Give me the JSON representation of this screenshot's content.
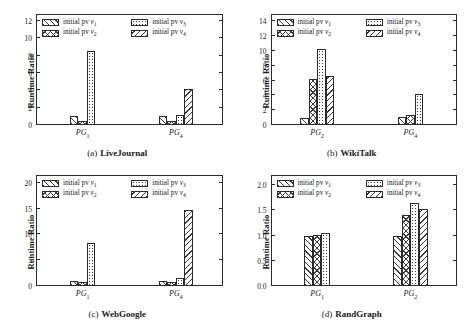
{
  "figure": {
    "ylabel": "Runtime Ratio",
    "legend_labels": [
      "initial pv v1",
      "initial pv v2",
      "initial pv v3",
      "initial pv v4"
    ],
    "legend_prefix": "initial pv",
    "series_names": [
      "v1",
      "v2",
      "v3",
      "v4"
    ],
    "series_patterns": [
      "backward-diagonal-hatch",
      "crosshatch",
      "dotted",
      "forward-diagonal-hatch"
    ],
    "colors": {
      "axis": "#2b2b2b",
      "hatch": "#3a3a3a",
      "background": "#ffffff",
      "text": "#1a1a1a"
    }
  },
  "chart_data": [
    {
      "type": "bar",
      "panel": "a",
      "caption_tag": "(a)",
      "title": "LiveJournal",
      "xlabel": "",
      "ylabel": "Runtime Ratio",
      "categories": [
        "PG1",
        "PG4"
      ],
      "category_labels": [
        "PG",
        "PG"
      ],
      "category_subs": [
        "1",
        "4"
      ],
      "yticks": [
        0,
        2,
        4,
        6,
        8,
        10,
        12
      ],
      "ytick_labels": [
        "0",
        "2",
        "4",
        "6",
        "8",
        "10",
        "12"
      ],
      "ylim": [
        0,
        12.8
      ],
      "grid": false,
      "legend_position": "upper-left-inside",
      "series": [
        {
          "name": "v1",
          "values": [
            1.0,
            1.0
          ]
        },
        {
          "name": "v2",
          "values": [
            0.5,
            0.5
          ]
        },
        {
          "name": "v3",
          "values": [
            8.5,
            1.2
          ]
        },
        {
          "name": "v4",
          "values": [
            0.0,
            4.1
          ]
        }
      ]
    },
    {
      "type": "bar",
      "panel": "b",
      "caption_tag": "(b)",
      "title": "WikiTalk",
      "xlabel": "",
      "ylabel": "Runtime Ratio",
      "categories": [
        "PG2",
        "PG4"
      ],
      "category_labels": [
        "PG",
        "PG"
      ],
      "category_subs": [
        "2",
        "4"
      ],
      "yticks": [
        0,
        2,
        4,
        6,
        8,
        10,
        12,
        14
      ],
      "ytick_labels": [
        "0",
        "2",
        "4",
        "6",
        "8",
        "10",
        "12",
        "14"
      ],
      "ylim": [
        0,
        15.0
      ],
      "grid": false,
      "legend_position": "upper-left-inside",
      "series": [
        {
          "name": "v1",
          "values": [
            1.0,
            1.1
          ]
        },
        {
          "name": "v2",
          "values": [
            6.2,
            1.4
          ]
        },
        {
          "name": "v3",
          "values": [
            10.3,
            4.2
          ]
        },
        {
          "name": "v4",
          "values": [
            6.6,
            0.0
          ]
        }
      ]
    },
    {
      "type": "bar",
      "panel": "c",
      "caption_tag": "(c)",
      "title": "WebGoogle",
      "xlabel": "",
      "ylabel": "Runtime Ratio",
      "categories": [
        "PG1",
        "PG4"
      ],
      "category_labels": [
        "PG",
        "PG"
      ],
      "category_subs": [
        "1",
        "4"
      ],
      "yticks": [
        0,
        5,
        10,
        15,
        20
      ],
      "ytick_labels": [
        "0",
        "5",
        "10",
        "15",
        "20"
      ],
      "ylim": [
        0,
        21.5
      ],
      "grid": false,
      "legend_position": "upper-left-inside",
      "series": [
        {
          "name": "v1",
          "values": [
            1.0,
            1.0
          ]
        },
        {
          "name": "v2",
          "values": [
            0.7,
            0.8
          ]
        },
        {
          "name": "v3",
          "values": [
            8.4,
            1.6
          ]
        },
        {
          "name": "v4",
          "values": [
            0.0,
            14.8
          ]
        }
      ]
    },
    {
      "type": "bar",
      "panel": "d",
      "caption_tag": "(d)",
      "title": "RandGraph",
      "xlabel": "",
      "ylabel": "Runtime Ratio",
      "categories": [
        "PG1",
        "PG2"
      ],
      "category_labels": [
        "PG",
        "PG"
      ],
      "category_subs": [
        "1",
        "2"
      ],
      "yticks": [
        0.0,
        0.5,
        1.0,
        1.5,
        2.0
      ],
      "ytick_labels": [
        "0.0",
        "0.5",
        "1.0",
        "1.5",
        "2.0"
      ],
      "ylim": [
        0.0,
        2.2
      ],
      "grid": false,
      "legend_position": "upper-left-inside",
      "series": [
        {
          "name": "v1",
          "values": [
            1.0,
            1.0
          ]
        },
        {
          "name": "v2",
          "values": [
            1.02,
            1.4
          ]
        },
        {
          "name": "v3",
          "values": [
            1.06,
            1.65
          ]
        },
        {
          "name": "v4",
          "values": [
            0.0,
            1.52
          ]
        }
      ]
    }
  ]
}
